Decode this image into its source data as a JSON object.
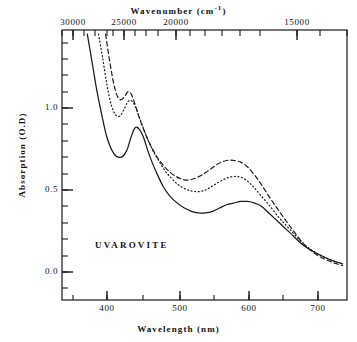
{
  "figure": {
    "sample_label": "UVAROVITE",
    "sample_label_x": 95,
    "sample_label_y": 240
  },
  "axes": {
    "top": {
      "title_main": "Wavenumber (cm",
      "title_sup": "-1",
      "title_tail": ")",
      "unit": "cm^-1",
      "ticks": [
        {
          "label": "30000",
          "x": 73
        },
        {
          "label": "25000",
          "x": 124
        },
        {
          "label": "20000",
          "x": 176
        },
        {
          "label": "15000",
          "x": 297
        }
      ],
      "minor_positions": [
        62,
        73,
        84,
        95,
        107,
        113,
        124,
        135,
        146,
        158,
        176,
        190,
        205,
        222,
        240,
        260,
        297,
        320,
        347
      ]
    },
    "bottom": {
      "title": "Wavelength (nm)",
      "unit": "nm",
      "ticks": [
        {
          "label": "400",
          "x": 107
        },
        {
          "label": "500",
          "x": 180
        },
        {
          "label": "600",
          "x": 249
        },
        {
          "label": "700",
          "x": 318
        }
      ],
      "minor_positions": [
        73,
        107,
        143,
        180,
        214,
        249,
        283,
        318
      ]
    },
    "left": {
      "title": "Absorption (O.D)",
      "ticks": [
        {
          "label": "1.0",
          "y": 108
        },
        {
          "label": "0.5",
          "y": 190
        },
        {
          "label": "0.0",
          "y": 272
        }
      ],
      "minor_positions": [
        43,
        59,
        75,
        92,
        108,
        124,
        141,
        157,
        174,
        190,
        206,
        223,
        239,
        256,
        272,
        288
      ]
    }
  },
  "chart_data": {
    "type": "line",
    "title": "UVAROVITE",
    "xlabel": "Wavelength (nm)",
    "ylabel": "Absorption (O.D)",
    "x2label": "Wavenumber (cm^-1)",
    "xlim": [
      350,
      740
    ],
    "ylim": [
      -0.05,
      1.45
    ],
    "x2lim": [
      30800,
      13800
    ],
    "grid": false,
    "legend": "none",
    "series": [
      {
        "name": "solid-curve",
        "style": "solid",
        "color": "#1a1a1a",
        "x": [
          372,
          378,
          385,
          392,
          400,
          410,
          420,
          428,
          434,
          440,
          446,
          452,
          458,
          464,
          470,
          480,
          490,
          500,
          510,
          520,
          530,
          540,
          550,
          560,
          570,
          580,
          590,
          600,
          610,
          620,
          630,
          645,
          660,
          680,
          700,
          720,
          735
        ],
        "y": [
          1.45,
          1.3,
          1.12,
          0.97,
          0.82,
          0.72,
          0.7,
          0.74,
          0.82,
          0.88,
          0.87,
          0.82,
          0.74,
          0.67,
          0.61,
          0.52,
          0.46,
          0.42,
          0.39,
          0.37,
          0.36,
          0.36,
          0.37,
          0.39,
          0.41,
          0.42,
          0.43,
          0.43,
          0.42,
          0.4,
          0.36,
          0.3,
          0.24,
          0.16,
          0.11,
          0.07,
          0.05
        ]
      },
      {
        "name": "dotted-curve",
        "style": "dotted",
        "color": "#1a1a1a",
        "x": [
          388,
          394,
          400,
          406,
          412,
          418,
          424,
          430,
          436,
          442,
          448,
          456,
          464,
          472,
          482,
          492,
          502,
          515,
          528,
          540,
          552,
          564,
          576,
          588,
          598,
          608,
          618,
          630,
          645,
          660,
          680,
          700,
          720,
          735
        ],
        "y": [
          1.45,
          1.3,
          1.14,
          1.02,
          0.96,
          0.95,
          0.99,
          1.04,
          1.04,
          0.99,
          0.92,
          0.83,
          0.75,
          0.69,
          0.62,
          0.57,
          0.53,
          0.5,
          0.49,
          0.5,
          0.53,
          0.56,
          0.58,
          0.58,
          0.56,
          0.52,
          0.47,
          0.41,
          0.33,
          0.26,
          0.17,
          0.11,
          0.07,
          0.05
        ]
      },
      {
        "name": "dashed-curve",
        "style": "dashed",
        "color": "#1a1a1a",
        "x": [
          398,
          404,
          410,
          415,
          420,
          425,
          430,
          435,
          440,
          446,
          452,
          460,
          470,
          480,
          492,
          504,
          516,
          530,
          545,
          558,
          570,
          580,
          590,
          600,
          610,
          620,
          632,
          645,
          660,
          680,
          700,
          720,
          735
        ],
        "y": [
          1.45,
          1.28,
          1.14,
          1.07,
          1.05,
          1.07,
          1.1,
          1.08,
          1.02,
          0.94,
          0.87,
          0.79,
          0.71,
          0.65,
          0.6,
          0.57,
          0.56,
          0.58,
          0.62,
          0.66,
          0.68,
          0.68,
          0.67,
          0.64,
          0.59,
          0.53,
          0.45,
          0.37,
          0.28,
          0.17,
          0.1,
          0.06,
          0.04
        ]
      }
    ]
  },
  "geometry": {
    "plot_left": 62,
    "plot_right": 347,
    "plot_top": 30,
    "plot_bottom": 300,
    "x_at_400nm": 107,
    "x_at_700nm": 318,
    "y_at_0": 272,
    "y_at_1": 108
  }
}
